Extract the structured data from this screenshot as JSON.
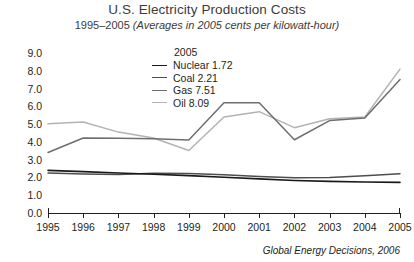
{
  "header": {
    "title": "U.S. Electricity Production Costs",
    "subtitle_range": "1995–2005",
    "subtitle_note": "(Averages in 2005 cents per kilowatt-hour)"
  },
  "legend": {
    "heading": "2005",
    "entries": [
      {
        "label": "Nuclear 1.72",
        "color": "#1a1a1a"
      },
      {
        "label": "Coal 2.21",
        "color": "#4d4d4d"
      },
      {
        "label": "Gas 7.51",
        "color": "#6e6e6e"
      },
      {
        "label": "Oil 8.09",
        "color": "#b3b3b3"
      }
    ]
  },
  "source": "Global Energy Decisions, 2006",
  "chart_data": {
    "type": "line",
    "title": "U.S. Electricity Production Costs",
    "subtitle": "1995–2005 (Averages in 2005 cents per kilowatt-hour)",
    "xlabel": "",
    "ylabel": "",
    "x": [
      1995,
      1996,
      1997,
      1998,
      1999,
      2000,
      2001,
      2002,
      2003,
      2004,
      2005
    ],
    "categories": [
      "1995",
      "1996",
      "1997",
      "1998",
      "1999",
      "2000",
      "2001",
      "2002",
      "2003",
      "2004",
      "2005"
    ],
    "ylim": [
      0.0,
      9.0
    ],
    "yticks": [
      "0.0",
      "1.0",
      "2.0",
      "3.0",
      "4.0",
      "5.0",
      "6.0",
      "7.0",
      "8.0",
      "9.0"
    ],
    "ytick_values": [
      0.0,
      1.0,
      2.0,
      3.0,
      4.0,
      5.0,
      6.0,
      7.0,
      8.0,
      9.0
    ],
    "grid": false,
    "legend_position": "upper-center",
    "series": [
      {
        "name": "Nuclear",
        "color": "#1a1a1a",
        "end_value": 1.72,
        "values": [
          2.4,
          2.33,
          2.25,
          2.18,
          2.1,
          2.01,
          1.92,
          1.83,
          1.78,
          1.74,
          1.72
        ]
      },
      {
        "name": "Coal",
        "color": "#4d4d4d",
        "end_value": 2.21,
        "values": [
          2.25,
          2.2,
          2.16,
          2.23,
          2.22,
          2.15,
          2.05,
          1.98,
          2.0,
          2.1,
          2.21
        ]
      },
      {
        "name": "Gas",
        "color": "#6e6e6e",
        "end_value": 7.51,
        "values": [
          3.4,
          4.22,
          4.2,
          4.18,
          4.1,
          6.2,
          6.2,
          4.12,
          5.2,
          5.35,
          7.51
        ]
      },
      {
        "name": "Oil",
        "color": "#b3b3b3",
        "end_value": 8.09,
        "values": [
          5.02,
          5.12,
          4.55,
          4.22,
          3.52,
          5.4,
          5.7,
          4.8,
          5.3,
          5.4,
          8.09
        ]
      }
    ]
  }
}
